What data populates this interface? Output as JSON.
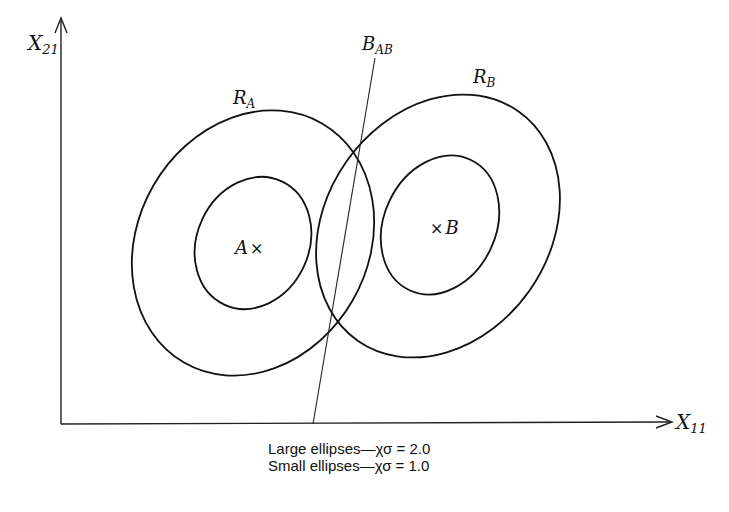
{
  "axes": {
    "y_label": "X",
    "y_label_sub": "21",
    "x_label": "X",
    "x_label_sub": "11"
  },
  "regions": {
    "a_label": "R",
    "a_label_sub": "A",
    "b_label": "R",
    "b_label_sub": "B"
  },
  "boundary": {
    "label": "B",
    "label_sub": "AB"
  },
  "centers": {
    "a": "A",
    "b": "B",
    "marker": "×"
  },
  "caption": {
    "line1": "Large ellipses—χσ = 2.0",
    "line2": "Small ellipses—χσ = 1.0"
  }
}
